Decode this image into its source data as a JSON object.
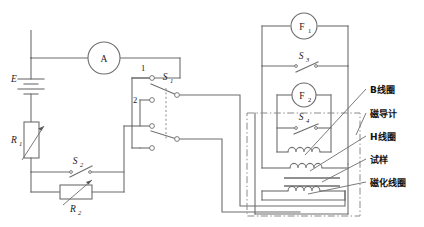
{
  "figure": {
    "kind": "circuit-diagram",
    "title": "",
    "line_color": "#6d6d6d",
    "text_color": "#1a1a1a",
    "background": "#ffffff"
  },
  "source_circuit": {
    "battery": {
      "label": "E"
    },
    "ammeter": {
      "label": "A"
    },
    "rheostat_1": {
      "label": "R",
      "sub": "1"
    },
    "rheostat_2": {
      "label": "R",
      "sub": "2"
    },
    "switch_2": {
      "label": "S",
      "sub": "2"
    },
    "switch_1": {
      "label": "S",
      "sub": "1"
    },
    "terminal_1": {
      "label": "1"
    },
    "terminal_2": {
      "label": "2"
    }
  },
  "measuring_circuit": {
    "fluxmeter_1": {
      "label": "F",
      "sub": "1"
    },
    "fluxmeter_2": {
      "label": "F",
      "sub": "2"
    },
    "switch_3": {
      "label": "S",
      "sub": "3"
    },
    "switch_4": {
      "label": "S",
      "sub": "4"
    }
  },
  "callouts": [
    {
      "id": "b-coil",
      "text": "B线圈"
    },
    {
      "id": "magnetometer",
      "text": "磁导计"
    },
    {
      "id": "h-coil",
      "text": "H线圈"
    },
    {
      "id": "sample",
      "text": "试样"
    },
    {
      "id": "magnetizing-coil",
      "text": "磁化线圈"
    }
  ]
}
